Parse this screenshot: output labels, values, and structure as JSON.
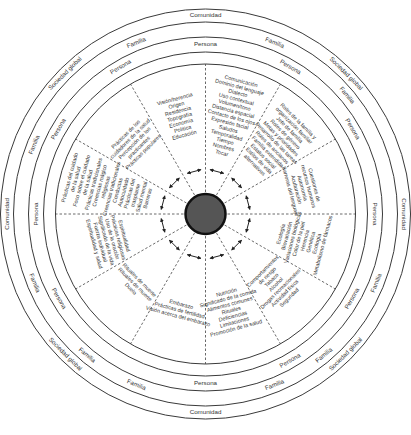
{
  "diagram": {
    "center": {
      "x": 205.5,
      "y": 214,
      "hub_radius": 20,
      "hub_color": "#555555"
    },
    "ring_labels": {
      "outer": "Comunidad",
      "sociedad": "Sociedad global",
      "familia": "Familia",
      "persona": "Persona"
    },
    "ring_label_positions": [
      {
        "text": "Comunidad",
        "ring": "comunidad",
        "angle": -90
      },
      {
        "text": "Comunidad",
        "ring": "comunidad",
        "angle": 180
      },
      {
        "text": "Comunidad",
        "ring": "comunidad",
        "angle": 0
      },
      {
        "text": "Comunidad",
        "ring": "comunidad",
        "angle": 90
      },
      {
        "text": "Sociedad global",
        "ring": "outer",
        "angle": -135
      },
      {
        "text": "Sociedad global",
        "ring": "outer",
        "angle": -45
      },
      {
        "text": "Sociedad global",
        "ring": "outer",
        "angle": 135
      },
      {
        "text": "Sociedad global",
        "ring": "outer",
        "angle": 45
      },
      {
        "text": "Familia",
        "ring": "familia",
        "angle": -112
      },
      {
        "text": "Familia",
        "ring": "familia",
        "angle": -68
      },
      {
        "text": "Familia",
        "ring": "familia",
        "angle": -40
      },
      {
        "text": "Familia",
        "ring": "familia",
        "angle": -158
      },
      {
        "text": "Familia",
        "ring": "familia",
        "angle": 158
      },
      {
        "text": "Familia",
        "ring": "familia",
        "angle": 22
      },
      {
        "text": "Familia",
        "ring": "familia",
        "angle": 130
      },
      {
        "text": "Familia",
        "ring": "familia",
        "angle": 50
      },
      {
        "text": "Familia",
        "ring": "familia",
        "angle": 112
      },
      {
        "text": "Familia",
        "ring": "familia",
        "angle": 68
      },
      {
        "text": "Persona",
        "ring": "persona",
        "angle": -90
      },
      {
        "text": "Persona",
        "ring": "persona",
        "angle": -120
      },
      {
        "text": "Persona",
        "ring": "persona",
        "angle": -60
      },
      {
        "text": "Persona",
        "ring": "persona",
        "angle": -150
      },
      {
        "text": "Persona",
        "ring": "persona",
        "angle": -30
      },
      {
        "text": "Persona",
        "ring": "persona",
        "angle": 180
      },
      {
        "text": "Persona",
        "ring": "persona",
        "angle": 0
      },
      {
        "text": "Persona",
        "ring": "persona",
        "angle": 150
      },
      {
        "text": "Persona",
        "ring": "persona",
        "angle": 30
      },
      {
        "text": "Persona",
        "ring": "persona",
        "angle": 90
      },
      {
        "text": "Persona",
        "ring": "persona",
        "angle": 60
      }
    ],
    "segments": [
      {
        "name": "herencia",
        "lines": [
          "Visión/herencia",
          "Origen",
          "Residencia",
          "Topografía",
          "Economía",
          "Política",
          "Educación"
        ]
      },
      {
        "name": "comunicacion",
        "lines": [
          "Comunicación",
          "Dominio del lenguaje",
          "Dialecto",
          "Uso contextual",
          "Volumen/tono",
          "Distancia espacial",
          "Contacto de los ojos",
          "Expresión facial",
          "Saludos",
          "Temporalidad",
          "Tiempo",
          "Nombres",
          "Tocar"
        ]
      },
      {
        "name": "familia",
        "lines": [
          "Roles de la familia y",
          "organización familiar",
          "Jefe de familia",
          "Roles de género",
          "Metas y prioridades",
          "Desarrollo de las tareas",
          "Roles de ancianos",
          "Familia extendida",
          "Estatus social",
          "Estilos de vida",
          "alternativos"
        ]
      },
      {
        "name": "trabajo",
        "lines": [
          "Cuestiones de",
          "recursos humanos",
          "Autonomía",
          "Aculturación",
          "Barreras del lenguaje"
        ]
      },
      {
        "name": "ecologia",
        "lines": [
          "Ecología",
          "Biovariación",
          "Variaciones biológicas",
          "Color de la piel",
          "Herencia",
          "Genética",
          "Ecología",
          "Metabolismo de fármacos"
        ]
      },
      {
        "name": "riesgo",
        "lines": [
          "Comportamientos",
          "de riesgo",
          "Tabaco",
          "Alcohol",
          "Drogas recreacionales",
          "Actividad física",
          "Seguridad"
        ]
      },
      {
        "name": "nutricion",
        "lines": [
          "Nutrición",
          "Significado de la comida",
          "Alimentos comunes",
          "Rituales",
          "Deficiencias",
          "Limitaciones",
          "Promoción de la salud"
        ]
      },
      {
        "name": "embarazo",
        "lines": [
          "Embarazo",
          "Prácticas de fertilidad",
          "Visión acerca del embarazo"
        ]
      },
      {
        "name": "muerte",
        "lines": [
          "Rituales de muerte",
          "Rituales de muerte",
          "Duelo"
        ]
      },
      {
        "name": "espiritualidad",
        "lines": [
          "Espiritualidad",
          "Prácticas religiosas",
          "Uso de la oración",
          "Significado de la vida",
          "Fuerza individual",
          "Espiritualidad y salud"
        ]
      },
      {
        "name": "cuidado",
        "lines": [
          "Prácticas del cuidado",
          "de la salud",
          "Foco sobre el cuidado",
          "de la salud",
          "Prácticas tradicionales",
          "Creencias mágico",
          "religiosas",
          "Creencias tradicionales",
          "Conductas",
          "Autocuidado",
          "Prácticas del",
          "trasplante",
          "Salud mental",
          "Barreras"
        ]
      },
      {
        "name": "practicantes",
        "lines": [
          "Prácticas de los",
          "cuidadores de la salud",
          "Percepción de los",
          "practicantes",
          "Prácticas populares"
        ]
      }
    ],
    "colors": {
      "line": "#3a3a3a",
      "text": "#333333",
      "hub": "#555555",
      "background": "#ffffff"
    }
  }
}
